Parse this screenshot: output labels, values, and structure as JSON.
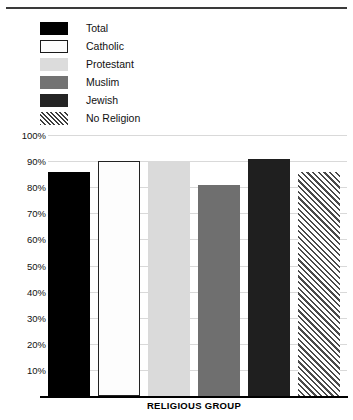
{
  "chart_data": {
    "type": "bar",
    "title": "",
    "subtitle": "",
    "xlabel": "RELIGIOUS GROUP",
    "ylabel": "",
    "categories": [
      "Total",
      "Catholic",
      "Protestant",
      "Muslim",
      "Jewish",
      "No Religion"
    ],
    "values": [
      86,
      90,
      90,
      81,
      91,
      86
    ],
    "ylim": [
      0,
      100
    ],
    "ytick_labels": [
      "100%",
      "90%",
      "80%",
      "70%",
      "60%",
      "50%",
      "40%",
      "30%",
      "20%",
      "10%"
    ],
    "ytick_values": [
      100,
      90,
      80,
      70,
      60,
      50,
      40,
      30,
      20,
      10
    ],
    "grid": true,
    "legend_position": "top-left",
    "series": [
      {
        "name": "Religious group share",
        "values": [
          86,
          90,
          90,
          81,
          91,
          86
        ]
      }
    ],
    "bar_styles": [
      {
        "category": "Total",
        "fill": "#000000",
        "pattern": "solid",
        "outline": "none"
      },
      {
        "category": "Catholic",
        "fill": "#fdfdfd",
        "pattern": "solid",
        "outline": "#222222"
      },
      {
        "category": "Protestant",
        "fill": "#dadada",
        "pattern": "solid",
        "outline": "none"
      },
      {
        "category": "Muslim",
        "fill": "#6f6f6f",
        "pattern": "solid",
        "outline": "none"
      },
      {
        "category": "Jewish",
        "fill": "#1f1f1f",
        "pattern": "solid",
        "outline": "none"
      },
      {
        "category": "No Religion",
        "fill": "#ffffff",
        "pattern": "diagonal-hatch",
        "outline": "none"
      }
    ]
  },
  "legend": {
    "items": [
      {
        "label": "Total",
        "swatch": "swatch-total"
      },
      {
        "label": "Catholic",
        "swatch": "swatch-catholic"
      },
      {
        "label": "Protestant",
        "swatch": "swatch-protestant"
      },
      {
        "label": "Muslim",
        "swatch": "swatch-muslim"
      },
      {
        "label": "Jewish",
        "swatch": "swatch-jewish"
      },
      {
        "label": "No Religion",
        "swatch": "swatch-no-religion"
      }
    ]
  },
  "axis": {
    "y_labels": [
      "100%",
      "90%",
      "80%",
      "70%",
      "60%",
      "50%",
      "40%",
      "30%",
      "20%",
      "10%"
    ],
    "x_title": "RELIGIOUS GROUP"
  },
  "colors": {
    "total": "#000000",
    "catholic": "#fdfdfd",
    "protestant": "#dadada",
    "muslim": "#6f6f6f",
    "jewish": "#1f1f1f",
    "no_religion_hatch": "#4a4a4a",
    "gridline": "#d9d9d9",
    "axis": "#000000",
    "text": "#111111"
  }
}
